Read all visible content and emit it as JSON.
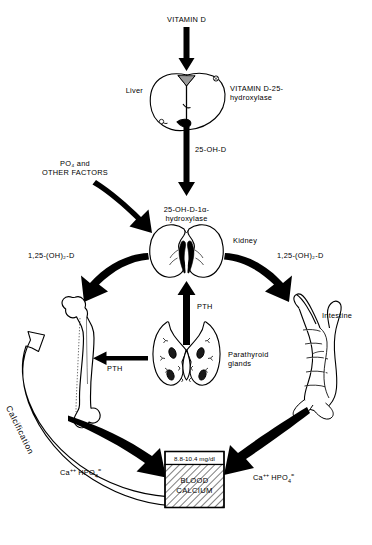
{
  "figure": {
    "background_color": "#ffffff",
    "ink_color": "#000000"
  },
  "labels": {
    "vitamin_d": "VITAMIN D",
    "liver": "Liver",
    "vitamin_d_25_hydroxylase": "VITAMIN D-25-\nhydroxylase",
    "oh_d_25": "25-OH-D",
    "po4_other_factors": "PO₄ and\nOTHER FACTORS",
    "one_alpha_hydroxylase": "25-OH-D-1α-\nhydroxylase",
    "kidney": "Kidney",
    "calcitriol_left": "1,25-(OH)₂-D",
    "calcitriol_right": "1,25-(OH)₂-D",
    "pth_vertical": "PTH",
    "pth_horizontal": "PTH",
    "parathyroid_glands": "Parathyroid\nglands",
    "intestine": "Intestine",
    "calcification": "Calcification",
    "blood_calcium_range": "8.8-10.4 mg/dl",
    "blood_calcium_title": "BLOOD\nCALCIUM"
  },
  "ion_labels": {
    "calcium_symbol": "Ca",
    "calcium_charge": "++",
    "phosphate_symbol": "HPO",
    "phosphate_sub": "4",
    "phosphate_charge": "="
  },
  "organs": [
    {
      "name": "liver",
      "label": "Liver"
    },
    {
      "name": "kidney",
      "label": "Kidney"
    },
    {
      "name": "bone",
      "label": ""
    },
    {
      "name": "parathyroid-glands",
      "label": "Parathyroid glands"
    },
    {
      "name": "intestine",
      "label": "Intestine"
    }
  ],
  "flows": [
    {
      "from": "vitamin-d",
      "to": "liver",
      "label": "VITAMIN D"
    },
    {
      "from": "liver",
      "to": "kidney",
      "label": "25-OH-D"
    },
    {
      "from": "po4-other-factors",
      "to": "kidney",
      "label": "PO₄ and OTHER FACTORS"
    },
    {
      "from": "kidney",
      "to": "bone",
      "label": "1,25-(OH)₂-D"
    },
    {
      "from": "kidney",
      "to": "intestine",
      "label": "1,25-(OH)₂-D"
    },
    {
      "from": "parathyroid-glands",
      "to": "kidney",
      "label": "PTH"
    },
    {
      "from": "parathyroid-glands",
      "to": "bone",
      "label": "PTH"
    },
    {
      "from": "bone",
      "to": "blood-calcium",
      "label": "Ca++ HPO4="
    },
    {
      "from": "intestine",
      "to": "blood-calcium",
      "label": "Ca++ HPO4="
    },
    {
      "from": "blood-calcium",
      "to": "bone",
      "label": "Calcification"
    }
  ],
  "blood_calcium": {
    "range": "8.8-10.4 mg/dl",
    "title": "BLOOD\nCALCIUM",
    "fill_pattern": "diagonal-hatch"
  }
}
